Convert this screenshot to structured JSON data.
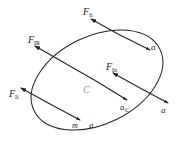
{
  "diagram": {
    "body": {
      "shape": "ellipse",
      "center_label": "C",
      "mass_label": "m"
    },
    "forces": [
      {
        "id": "top",
        "label": "F",
        "subscript": "Ii",
        "accel_label": "a"
      },
      {
        "id": "resultant",
        "label": "F",
        "subscript": "IR",
        "accel_label": "a",
        "accel_subscript": "C"
      },
      {
        "id": "right",
        "label": "F",
        "subscript": "In",
        "accel_label": "a"
      },
      {
        "id": "left",
        "label": "F",
        "subscript": "Ii",
        "accel_label": "a"
      }
    ],
    "colors": {
      "line": "#222222",
      "center_label": "#999999",
      "background": "#ffffff"
    }
  }
}
